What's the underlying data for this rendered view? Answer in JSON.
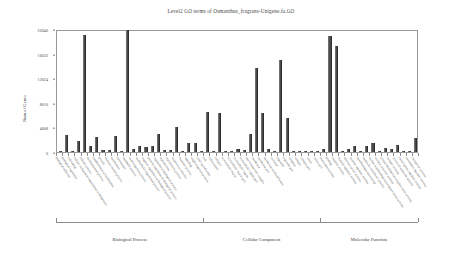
{
  "chart_data": {
    "type": "bar",
    "title": "Level2 GO terms of Osmanthus_fragrans-Unigene.fa.GO",
    "xlabel": "",
    "ylabel": "Num of Genes",
    "ylim": [
      0,
      20040
    ],
    "yticks": [
      0,
      4008,
      8016,
      12024,
      16032,
      20040
    ],
    "ytick_labels": [
      "0",
      "4008",
      "8016",
      "12024",
      "16032",
      "20040"
    ],
    "grid": false,
    "legend": "none",
    "bar_color": "#4a4a4a",
    "groups": [
      {
        "name": "Biological Process",
        "start": 0,
        "end": 24
      },
      {
        "name": "Cellular Component",
        "start": 24,
        "end": 43
      },
      {
        "name": "Molecular Function",
        "start": 43,
        "end": 59
      }
    ],
    "categories": [
      "biological adhesion",
      "biological regulation",
      "cell killing",
      "cellular component organization or biogenesis",
      "cellular process",
      "developmental process",
      "establishment of localization",
      "growth",
      "immune system process",
      "localization",
      "locomotion",
      "metabolic process",
      "multi-organism process",
      "multicellular organismal process",
      "negative regulation of biological process",
      "positive regulation of biological process",
      "regulation of biological process",
      "reproduction",
      "reproductive process",
      "response to stimulus",
      "rhythmic process",
      "signaling",
      "single-organism process",
      "viral reproduction",
      "cell",
      "cell junction",
      "cell part",
      "extracellular matrix",
      "extracellular matrix part",
      "extracellular region",
      "extracellular region part",
      "macromolecular complex",
      "membrane",
      "membrane part",
      "membrane-enclosed lumen",
      "nucleoid",
      "organelle",
      "organelle part",
      "symplast",
      "synapse",
      "synapse part",
      "virion",
      "virion part",
      "antioxidant activity",
      "binding",
      "catalytic activity",
      "channel regulator activity",
      "electron carrier activity",
      "enzyme regulator activity",
      "metallochaperone activity",
      "molecular transducer activity",
      "nucleic acid binding transcription factor activity",
      "nutrient reservoir activity",
      "protein binding transcription factor activity",
      "receptor activity",
      "structural molecule activity",
      "transcription regulator activity",
      "translation regulator activity",
      "transporter activity"
    ],
    "values": [
      110,
      2700,
      40,
      1800,
      19000,
      900,
      2500,
      360,
      280,
      2620,
      130,
      19900,
      520,
      980,
      830,
      900,
      3000,
      330,
      300,
      4000,
      35,
      1500,
      1460,
      60,
      6550,
      180,
      6400,
      150,
      70,
      520,
      330,
      3000,
      13700,
      6300,
      560,
      40,
      15000,
      5600,
      120,
      90,
      60,
      130,
      60,
      420,
      18900,
      17200,
      40,
      420,
      900,
      60,
      1000,
      1400,
      120,
      620,
      560,
      1100,
      150,
      90,
      2300
    ]
  }
}
